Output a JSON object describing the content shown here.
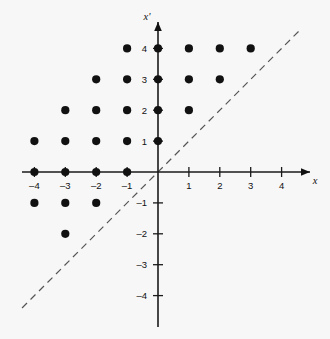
{
  "figure": {
    "background_color": "#f7f7f7",
    "ink_color": "#111111",
    "dash_color": "#555555",
    "width": 330,
    "height": 339
  },
  "chart_data": {
    "type": "scatter",
    "title": "",
    "subtitle": "",
    "xlabel": "x",
    "ylabel": "x'",
    "xlim": [
      -4.8,
      5.2
    ],
    "ylim": [
      -4.8,
      5.0
    ],
    "grid": false,
    "legend": null,
    "xticks": [
      -4,
      -3,
      -2,
      -1,
      1,
      2,
      3,
      4
    ],
    "yticks": [
      4,
      3,
      2,
      1,
      -1,
      -2,
      -3,
      -4
    ],
    "xticklabels": [
      "–4",
      "–3",
      "–2",
      "–1",
      "1",
      "2",
      "3",
      "4"
    ],
    "yticklabels": [
      "4",
      "3",
      "2",
      "1",
      "–1",
      "–2",
      "–3",
      "–4"
    ],
    "series": [
      {
        "name": "lattice-points",
        "marker": "filled-circle",
        "marker_color": "#111111",
        "marker_size": 4.1,
        "points": [
          {
            "x": -1,
            "y": 4
          },
          {
            "x": 0,
            "y": 4
          },
          {
            "x": 1,
            "y": 4
          },
          {
            "x": 2,
            "y": 4
          },
          {
            "x": 3,
            "y": 4
          },
          {
            "x": -2,
            "y": 3
          },
          {
            "x": -1,
            "y": 3
          },
          {
            "x": 0,
            "y": 3
          },
          {
            "x": 1,
            "y": 3
          },
          {
            "x": 2,
            "y": 3
          },
          {
            "x": -3,
            "y": 2
          },
          {
            "x": -2,
            "y": 2
          },
          {
            "x": -1,
            "y": 2
          },
          {
            "x": 0,
            "y": 2
          },
          {
            "x": 1,
            "y": 2
          },
          {
            "x": -4,
            "y": 1
          },
          {
            "x": -3,
            "y": 1
          },
          {
            "x": -2,
            "y": 1
          },
          {
            "x": -1,
            "y": 1
          },
          {
            "x": 0,
            "y": 1
          },
          {
            "x": -4,
            "y": 0
          },
          {
            "x": -3,
            "y": 0
          },
          {
            "x": -2,
            "y": 0
          },
          {
            "x": -1,
            "y": 0
          },
          {
            "x": -4,
            "y": -1
          },
          {
            "x": -3,
            "y": -1
          },
          {
            "x": -2,
            "y": -1
          },
          {
            "x": -3,
            "y": -2
          }
        ]
      }
    ],
    "annotations": [
      {
        "name": "identity-line",
        "kind": "line",
        "style": "dashed",
        "equation": "x' = x",
        "from": {
          "x": -4.4,
          "y": -4.4
        },
        "to": {
          "x": 4.65,
          "y": 4.65
        },
        "color": "#555555"
      }
    ]
  }
}
